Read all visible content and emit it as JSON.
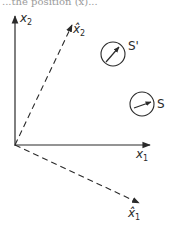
{
  "diagram": {
    "top_text_fragment": "...the position (x)...",
    "axes": {
      "x1": {
        "label": "x",
        "sub": "1",
        "style": "solid"
      },
      "x2": {
        "label": "x",
        "sub": "2",
        "style": "solid"
      },
      "x1_hat": {
        "label": "x̂",
        "sub": "1",
        "style": "dashed"
      },
      "x2_hat": {
        "label": "x̂",
        "sub": "2",
        "style": "dashed"
      }
    },
    "objects": [
      {
        "id": "S_prime",
        "label": "S'"
      },
      {
        "id": "S",
        "label": "S"
      }
    ],
    "colors": {
      "ink": "#2a2a2a",
      "background": "#ffffff"
    }
  }
}
